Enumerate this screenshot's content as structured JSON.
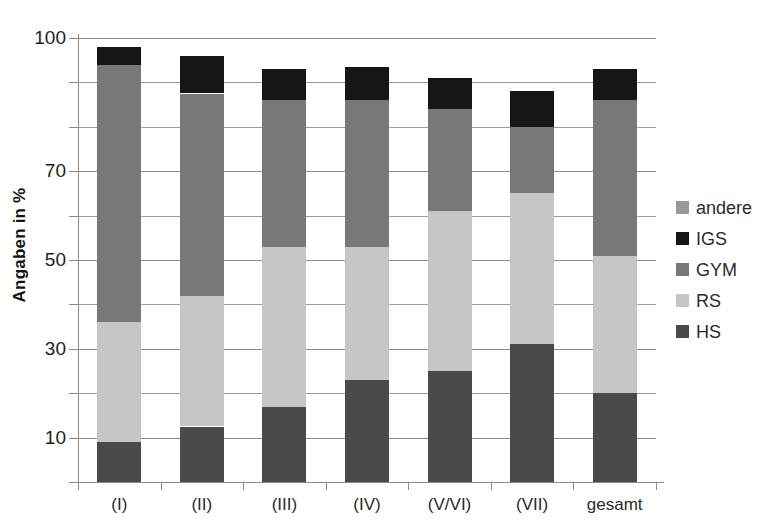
{
  "chart_data": {
    "type": "bar",
    "subtype": "stacked-bar",
    "title": "",
    "xlabel": "",
    "ylabel": "Angaben in %",
    "ylim": [
      0,
      100
    ],
    "yticks": [
      0,
      10,
      20,
      30,
      40,
      50,
      60,
      70,
      80,
      90,
      100
    ],
    "ytick_labels": [
      "",
      "10",
      "",
      "30",
      "",
      "50",
      "",
      "70",
      "",
      "",
      "100"
    ],
    "grid": true,
    "legend_position": "right",
    "categories": [
      "(I)",
      "(II)",
      "(III)",
      "(IV)",
      "(V/VI)",
      "(VII)",
      "gesamt"
    ],
    "series": [
      {
        "name": "HS",
        "color": "#4a4a4a",
        "values": [
          9,
          12.5,
          17,
          23,
          25,
          31,
          20
        ]
      },
      {
        "name": "RS",
        "color": "#c6c6c6",
        "values": [
          27,
          29.5,
          36,
          30,
          36,
          34,
          31
        ]
      },
      {
        "name": "GYM",
        "color": "#787878",
        "values": [
          58,
          45.5,
          33,
          33,
          23,
          15,
          35
        ]
      },
      {
        "name": "IGS",
        "color": "#161616",
        "values": [
          4,
          8.5,
          7,
          7.5,
          7,
          8,
          7
        ]
      },
      {
        "name": "andere",
        "color": "#9a9a9a",
        "values": [
          0,
          0,
          0,
          0,
          0,
          0,
          0
        ]
      }
    ],
    "totals": [
      98,
      96,
      93,
      93.5,
      91,
      88,
      93
    ],
    "legend_order": [
      "andere",
      "IGS",
      "GYM",
      "RS",
      "HS"
    ]
  },
  "axis": {
    "y_title": "Angaben in %"
  },
  "legend": {
    "items": [
      {
        "label": "andere",
        "color": "#9a9a9a"
      },
      {
        "label": "IGS",
        "color": "#161616"
      },
      {
        "label": "GYM",
        "color": "#787878"
      },
      {
        "label": "RS",
        "color": "#c6c6c6"
      },
      {
        "label": "HS",
        "color": "#4a4a4a"
      }
    ]
  }
}
